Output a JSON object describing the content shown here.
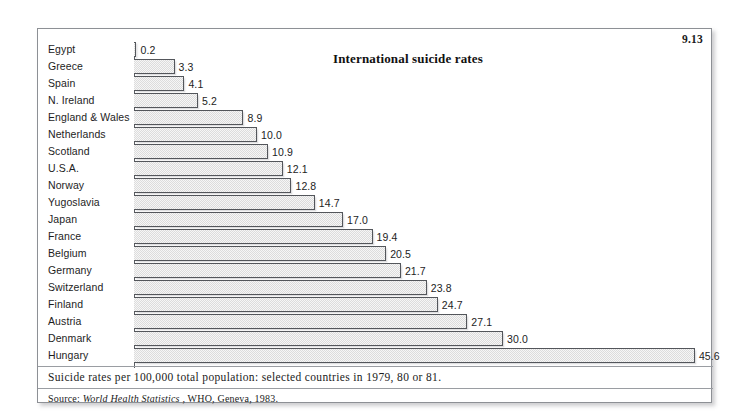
{
  "figure": {
    "number": "9.13",
    "caption": "Suicide rates per 100,000 total population: selected countries in 1979, 80 or 81.",
    "source_prefix": "Source:",
    "source_publication": "World Health Statistics",
    "source_rest": ", WHO, Geneva, 1983."
  },
  "chart_data": {
    "type": "bar",
    "orientation": "horizontal",
    "title": "International suicide rates",
    "xlabel": "",
    "ylabel": "",
    "xlim": [
      0,
      45.6
    ],
    "grid": false,
    "legend": null,
    "value_labels": true,
    "categories": [
      "Egypt",
      "Greece",
      "Spain",
      "N. Ireland",
      "England & Wales",
      "Netherlands",
      "Scotland",
      "U.S.A.",
      "Norway",
      "Yugoslavia",
      "Japan",
      "France",
      "Belgium",
      "Germany",
      "Switzerland",
      "Finland",
      "Austria",
      "Denmark",
      "Hungary"
    ],
    "values": [
      0.2,
      3.3,
      4.1,
      5.2,
      8.9,
      10.0,
      10.9,
      12.1,
      12.8,
      14.7,
      17.0,
      19.4,
      20.5,
      21.7,
      23.8,
      24.7,
      27.1,
      30.0,
      45.6
    ],
    "value_text": [
      "0.2",
      "3.3",
      "4.1",
      "5.2",
      "8.9",
      "10.0",
      "10.9",
      "12.1",
      "12.8",
      "14.7",
      "17.0",
      "19.4",
      "20.5",
      "21.7",
      "23.8",
      "24.7",
      "27.1",
      "30.0",
      "45.6"
    ],
    "colors": {
      "bar_fill": "#f1f1f1",
      "bar_stipple": "#dcdcdc",
      "bar_outline": "#53565b",
      "text": "#1d1d1d",
      "frame": "#8d9095"
    }
  }
}
